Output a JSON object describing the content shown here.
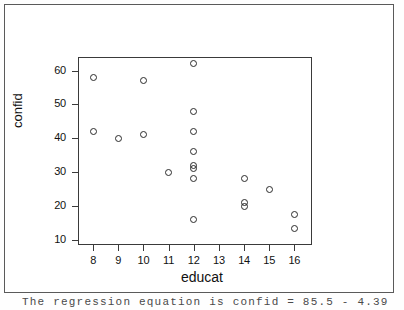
{
  "chart_data": {
    "type": "scatter",
    "title": "",
    "xlabel": "educat",
    "ylabel": "confid",
    "xlim": [
      7.4,
      16.7
    ],
    "ylim": [
      8.5,
      64.0
    ],
    "xticks": [
      8,
      9,
      10,
      11,
      12,
      13,
      14,
      15,
      16
    ],
    "xtick_labels": [
      "8",
      "9",
      "10",
      "11",
      "12",
      "13",
      "14",
      "15",
      "16"
    ],
    "yticks": [
      10,
      20,
      30,
      40,
      50,
      60
    ],
    "ytick_labels": [
      "10",
      "20",
      "30",
      "40",
      "50",
      "60"
    ],
    "grid": false,
    "legend": false,
    "marker": "open-circle",
    "marker_color": "#2b2b2b",
    "frame_color": "#3a3a3a",
    "points": [
      {
        "x": 8,
        "y": 58
      },
      {
        "x": 8,
        "y": 42
      },
      {
        "x": 9,
        "y": 40
      },
      {
        "x": 10,
        "y": 57
      },
      {
        "x": 10,
        "y": 41
      },
      {
        "x": 11,
        "y": 30
      },
      {
        "x": 12,
        "y": 62
      },
      {
        "x": 12,
        "y": 48
      },
      {
        "x": 12,
        "y": 42
      },
      {
        "x": 12,
        "y": 36
      },
      {
        "x": 12,
        "y": 32
      },
      {
        "x": 12,
        "y": 31
      },
      {
        "x": 12,
        "y": 28
      },
      {
        "x": 12,
        "y": 16
      },
      {
        "x": 14,
        "y": 28
      },
      {
        "x": 14,
        "y": 21
      },
      {
        "x": 14,
        "y": 20
      },
      {
        "x": 15,
        "y": 25
      },
      {
        "x": 16,
        "y": 17.5
      },
      {
        "x": 16,
        "y": 13.5
      }
    ]
  },
  "caption": {
    "text": "The regression equation is    confid = 85.5 - 4.39"
  }
}
